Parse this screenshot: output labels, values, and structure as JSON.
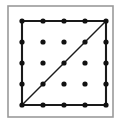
{
  "figure": {
    "caption": "",
    "background_color": "#ffffff"
  },
  "outer_frame": {
    "name": "outer-frame",
    "x": 8,
    "y": 6,
    "width": 105,
    "height": 111,
    "stroke_color": "#9a9a9a",
    "stroke_width": 1.6,
    "fill_color": "#ffffff"
  },
  "chart_data": {
    "type": "scatter",
    "xlabel": "",
    "ylabel": "",
    "xlim": [
      0,
      4
    ],
    "ylim": [
      0,
      4
    ],
    "grid": false,
    "legend": "none",
    "rows": 5,
    "cols": 5,
    "dot_count": 25,
    "dot_radius": 2.6,
    "dot_color": "#111111",
    "x_positions": [
      22,
      43,
      64,
      85,
      106
    ],
    "y_positions": [
      21,
      42,
      63,
      84,
      105
    ],
    "points": [
      {
        "col": 0,
        "row": 0,
        "x": 22,
        "y": 21
      },
      {
        "col": 1,
        "row": 0,
        "x": 43,
        "y": 21
      },
      {
        "col": 2,
        "row": 0,
        "x": 64,
        "y": 21
      },
      {
        "col": 3,
        "row": 0,
        "x": 85,
        "y": 21
      },
      {
        "col": 4,
        "row": 0,
        "x": 106,
        "y": 21
      },
      {
        "col": 0,
        "row": 1,
        "x": 22,
        "y": 42
      },
      {
        "col": 1,
        "row": 1,
        "x": 43,
        "y": 42
      },
      {
        "col": 2,
        "row": 1,
        "x": 64,
        "y": 42
      },
      {
        "col": 3,
        "row": 1,
        "x": 85,
        "y": 42
      },
      {
        "col": 4,
        "row": 1,
        "x": 106,
        "y": 42
      },
      {
        "col": 0,
        "row": 2,
        "x": 22,
        "y": 63
      },
      {
        "col": 1,
        "row": 2,
        "x": 43,
        "y": 63
      },
      {
        "col": 2,
        "row": 2,
        "x": 64,
        "y": 63
      },
      {
        "col": 3,
        "row": 2,
        "x": 85,
        "y": 63
      },
      {
        "col": 4,
        "row": 2,
        "x": 106,
        "y": 63
      },
      {
        "col": 0,
        "row": 3,
        "x": 22,
        "y": 84
      },
      {
        "col": 1,
        "row": 3,
        "x": 43,
        "y": 84
      },
      {
        "col": 2,
        "row": 3,
        "x": 64,
        "y": 84
      },
      {
        "col": 3,
        "row": 3,
        "x": 85,
        "y": 84
      },
      {
        "col": 4,
        "row": 3,
        "x": 106,
        "y": 84
      },
      {
        "col": 0,
        "row": 4,
        "x": 22,
        "y": 105
      },
      {
        "col": 1,
        "row": 4,
        "x": 43,
        "y": 105
      },
      {
        "col": 2,
        "row": 4,
        "x": 64,
        "y": 105
      },
      {
        "col": 3,
        "row": 4,
        "x": 85,
        "y": 105
      },
      {
        "col": 4,
        "row": 4,
        "x": 106,
        "y": 105
      }
    ],
    "shapes": [
      {
        "name": "grid-square",
        "kind": "rectangle",
        "path": "M 22 21 L 106 21 L 106 105 L 22 105 Z",
        "stroke_color": "#1a1a1a",
        "stroke_width": 2.1,
        "fill": "none"
      },
      {
        "name": "diagonal",
        "kind": "line",
        "x1": 22,
        "y1": 105,
        "x2": 106,
        "y2": 21,
        "stroke_color": "#1a1a1a",
        "stroke_width": 1.5
      }
    ]
  }
}
